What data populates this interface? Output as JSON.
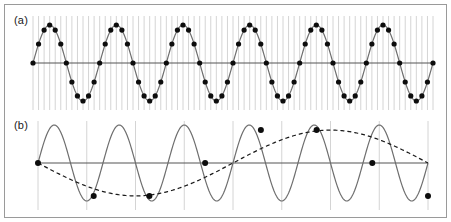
{
  "figure": {
    "border_color": "#9a9a9a",
    "background": "#ffffff",
    "width": 451,
    "height": 222
  },
  "panels": [
    {
      "id": "a",
      "label": "(a)",
      "caption_text": "(a)",
      "description": "Adequately sampled sine wave"
    },
    {
      "id": "b",
      "label": "(b)",
      "caption_text": "(b)",
      "description": "Undersampled sine wave showing aliasing"
    }
  ],
  "colors": {
    "signal_line": "#6e6e6e",
    "axis_line": "#555555",
    "grid_line": "#c9c9c9",
    "sample_dot": "#0d0d0d",
    "alias_line": "#1a1a1a",
    "panel_label": "#1a1a1a"
  },
  "chart_data": [
    {
      "type": "line",
      "panel": "a",
      "title": "(a)",
      "xlabel": "",
      "ylabel": "",
      "grid": true,
      "grid_orientation": "vertical",
      "grid_line_count": 72,
      "legend": "none",
      "xlim": [
        0,
        6
      ],
      "ylim": [
        -1,
        1
      ],
      "series": [
        {
          "name": "signal",
          "style": "solid",
          "color": "#6e6e6e",
          "waveform": "sine",
          "cycles": 6,
          "amplitude": 1,
          "phase_deg": 0,
          "points": 600
        },
        {
          "name": "samples",
          "style": "markers",
          "color": "#0d0d0d",
          "marker": "filled-circle",
          "marker_radius_px": 2.6,
          "samples_per_cycle": 12,
          "sample_count": 73,
          "sampled_from": "signal"
        }
      ],
      "axis": {
        "zero_line": true,
        "zero_line_color": "#555555"
      }
    },
    {
      "type": "line",
      "panel": "b",
      "title": "(b)",
      "xlabel": "",
      "ylabel": "",
      "grid": true,
      "grid_orientation": "vertical",
      "grid_line_count": 8,
      "legend": "none",
      "xlim": [
        0,
        6
      ],
      "ylim": [
        -1,
        1
      ],
      "series": [
        {
          "name": "signal",
          "style": "solid",
          "color": "#6e6e6e",
          "waveform": "sine",
          "cycles": 6,
          "amplitude": 1,
          "phase_deg": 0,
          "points": 600
        },
        {
          "name": "samples",
          "style": "markers",
          "color": "#0d0d0d",
          "marker": "filled-circle",
          "marker_radius_px": 3.0,
          "samples_per_cycle": 1.1667,
          "sample_count": 8,
          "sample_x": [
            0,
            0.857,
            1.714,
            2.571,
            3.429,
            4.286,
            5.143,
            6.0
          ],
          "sample_y": [
            0,
            -0.866,
            -0.866,
            0,
            0.866,
            0.866,
            0,
            -0.866
          ]
        },
        {
          "name": "alias",
          "style": "dashed",
          "color": "#1a1a1a",
          "dash_px": [
            4,
            3
          ],
          "waveform": "sine",
          "cycles": 1,
          "amplitude": 0.866,
          "phase_deg": 180,
          "points": 400
        }
      ],
      "axis": {
        "zero_line": true,
        "zero_line_color": "#555555"
      }
    }
  ]
}
